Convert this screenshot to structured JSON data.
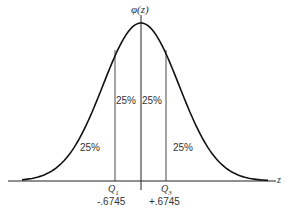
{
  "figure": {
    "y_axis_label": "φ(z)",
    "x_axis_label": "z",
    "regions": [
      {
        "id": "left-tail",
        "label": "25%"
      },
      {
        "id": "left-center",
        "label": "25%"
      },
      {
        "id": "right-center",
        "label": "25%"
      },
      {
        "id": "right-tail",
        "label": "25%"
      }
    ],
    "quartiles": [
      {
        "name": "Q",
        "sub": "1",
        "value": "-.6745"
      },
      {
        "name": "Q",
        "sub": "3",
        "value": "+.6745"
      }
    ]
  },
  "chart_data": {
    "type": "area",
    "title": "",
    "xlabel": "z",
    "ylabel": "φ(z)",
    "curve": "standard normal density",
    "dividers": [
      -0.6745,
      0,
      0.6745
    ],
    "region_percentages": [
      25,
      25,
      25,
      25
    ],
    "annotations": [
      "Q1 = -.6745",
      "Q3 = +.6745"
    ]
  }
}
